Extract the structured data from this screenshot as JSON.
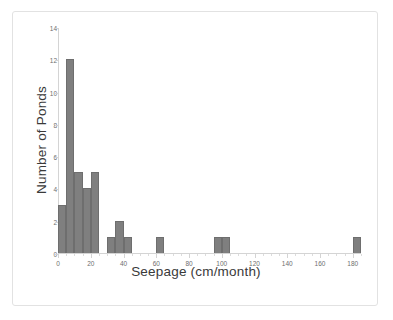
{
  "chart_data": {
    "type": "bar",
    "title": "",
    "xlabel": "Seepage (cm/month)",
    "ylabel": "Number of Ponds",
    "xlim": [
      0,
      185
    ],
    "ylim": [
      0,
      14
    ],
    "bin_width": 5,
    "grid": false,
    "legend": false,
    "bar_color": "#7f7f7f",
    "bar_edge_color": "#6e6e6e",
    "axis_color": "#d4d4d4",
    "tick_label_color": "#6e6e6e",
    "axis_title_color": "#3a3a3a",
    "x_ticks": [
      0,
      20,
      40,
      60,
      80,
      100,
      120,
      140,
      160,
      180
    ],
    "x_tick_labels": [
      "0",
      "20",
      "40",
      "60",
      "80",
      "100",
      "120",
      "140",
      "160",
      "180"
    ],
    "x_minor_tick_step": 5,
    "y_ticks": [
      0,
      2,
      4,
      6,
      8,
      10,
      12,
      14
    ],
    "y_tick_labels": [
      "0",
      "2",
      "4",
      "6",
      "8",
      "10",
      "12",
      "14"
    ],
    "bins": [
      {
        "start": 0,
        "end": 5,
        "count": 3
      },
      {
        "start": 5,
        "end": 10,
        "count": 12
      },
      {
        "start": 10,
        "end": 15,
        "count": 5
      },
      {
        "start": 15,
        "end": 20,
        "count": 4
      },
      {
        "start": 20,
        "end": 25,
        "count": 5
      },
      {
        "start": 30,
        "end": 35,
        "count": 1
      },
      {
        "start": 35,
        "end": 40,
        "count": 2
      },
      {
        "start": 40,
        "end": 45,
        "count": 1
      },
      {
        "start": 60,
        "end": 65,
        "count": 1
      },
      {
        "start": 95,
        "end": 100,
        "count": 1
      },
      {
        "start": 100,
        "end": 105,
        "count": 1
      },
      {
        "start": 180,
        "end": 185,
        "count": 1
      }
    ],
    "categories": [
      "0-5",
      "5-10",
      "10-15",
      "15-20",
      "20-25",
      "30-35",
      "35-40",
      "40-45",
      "60-65",
      "95-100",
      "100-105",
      "180-185"
    ],
    "values": [
      3,
      12,
      5,
      4,
      5,
      1,
      2,
      1,
      1,
      1,
      1,
      1
    ]
  }
}
